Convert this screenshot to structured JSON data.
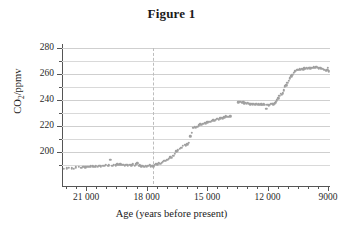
{
  "figure": {
    "title": "Figure 1"
  },
  "chart_data": {
    "type": "scatter",
    "title": "Figure 1",
    "xlabel": "Age (years before present)",
    "ylabel": "CO2/ppmv",
    "ylabel_html": "CO<sub>2</sub>/ppmv",
    "xlim": [
      22200,
      8900
    ],
    "ylim": [
      185,
      285
    ],
    "x_inverted": true,
    "grid": "horizontal",
    "legend": "none",
    "marker": {
      "shape": "circle",
      "color": "#a0a0a0",
      "size_px": 2.4
    },
    "xticks_major": [
      21000,
      18000,
      15000,
      12000,
      9000
    ],
    "xticks_major_labels": [
      "21 000",
      "18 000",
      "15 000",
      "12 000",
      "9000"
    ],
    "xticks_minor_step": 500,
    "yticks_major": [
      200,
      220,
      240,
      260,
      280
    ],
    "yticks_major_labels": [
      "200",
      "220",
      "240",
      "260",
      "280"
    ],
    "yticks_minor_step": 10,
    "annotations": [
      {
        "type": "vline",
        "x": 17700,
        "style": "dashed",
        "color": "#bdbdbd"
      }
    ],
    "series": [
      {
        "name": "CO2 concentration",
        "points": [
          [
            22100,
            187.0
          ],
          [
            21950,
            187.5
          ],
          [
            21850,
            188.0
          ],
          [
            21700,
            187.6
          ],
          [
            21600,
            187.3
          ],
          [
            21500,
            188.2
          ],
          [
            21380,
            188.4
          ],
          [
            21250,
            188.0
          ],
          [
            21150,
            188.6
          ],
          [
            21050,
            188.3
          ],
          [
            20950,
            188.8
          ],
          [
            20850,
            188.5
          ],
          [
            20760,
            188.9
          ],
          [
            20680,
            189.1
          ],
          [
            20600,
            188.7
          ],
          [
            20520,
            189.0
          ],
          [
            20430,
            188.6
          ],
          [
            20350,
            189.3
          ],
          [
            20260,
            189.0
          ],
          [
            20180,
            189.6
          ],
          [
            20100,
            189.2
          ],
          [
            20020,
            190.0
          ],
          [
            19940,
            189.4
          ],
          [
            19870,
            189.8
          ],
          [
            19800,
            193.9
          ],
          [
            19700,
            189.5
          ],
          [
            19620,
            190.2
          ],
          [
            19540,
            189.8
          ],
          [
            19460,
            190.4
          ],
          [
            19380,
            190.0
          ],
          [
            19300,
            190.6
          ],
          [
            19230,
            190.2
          ],
          [
            19150,
            190.0
          ],
          [
            19070,
            189.6
          ],
          [
            19000,
            190.3
          ],
          [
            18920,
            189.9
          ],
          [
            18840,
            190.1
          ],
          [
            18760,
            189.7
          ],
          [
            18680,
            190.4
          ],
          [
            18600,
            189.4
          ],
          [
            18530,
            190.6
          ],
          [
            18460,
            191.4
          ],
          [
            18400,
            189.2
          ],
          [
            18330,
            189.8
          ],
          [
            18260,
            189.0
          ],
          [
            18190,
            189.4
          ],
          [
            18120,
            188.8
          ],
          [
            18050,
            189.2
          ],
          [
            17980,
            188.6
          ],
          [
            17910,
            189.6
          ],
          [
            17840,
            190.2
          ],
          [
            17780,
            189.0
          ],
          [
            17720,
            189.6
          ],
          [
            17660,
            188.9
          ],
          [
            17600,
            190.3
          ],
          [
            17540,
            190.8
          ],
          [
            17470,
            190.4
          ],
          [
            17400,
            191.6
          ],
          [
            17330,
            190.9
          ],
          [
            17260,
            191.8
          ],
          [
            17190,
            192.6
          ],
          [
            17120,
            193.4
          ],
          [
            17050,
            193.0
          ],
          [
            16980,
            193.9
          ],
          [
            16900,
            194.8
          ],
          [
            16830,
            196.0
          ],
          [
            16760,
            195.4
          ],
          [
            16680,
            197.2
          ],
          [
            16600,
            198.4
          ],
          [
            16520,
            200.6
          ],
          [
            16440,
            201.3
          ],
          [
            16360,
            202.4
          ],
          [
            16280,
            203.1
          ],
          [
            16200,
            204.8
          ],
          [
            16120,
            205.6
          ],
          [
            16050,
            205.3
          ],
          [
            15980,
            206.0
          ],
          [
            15900,
            207.0
          ],
          [
            15830,
            212.2
          ],
          [
            15760,
            214.6
          ],
          [
            15690,
            218.5
          ],
          [
            15620,
            219.2
          ],
          [
            15550,
            218.8
          ],
          [
            15480,
            219.6
          ],
          [
            15400,
            220.4
          ],
          [
            15330,
            221.3
          ],
          [
            15260,
            220.8
          ],
          [
            15190,
            221.9
          ],
          [
            15120,
            222.4
          ],
          [
            15050,
            222.0
          ],
          [
            14980,
            222.9
          ],
          [
            14910,
            223.4
          ],
          [
            14840,
            223.0
          ],
          [
            14770,
            223.8
          ],
          [
            14700,
            224.4
          ],
          [
            14630,
            224.0
          ],
          [
            14560,
            224.9
          ],
          [
            14490,
            225.4
          ],
          [
            14420,
            225.0
          ],
          [
            14350,
            225.8
          ],
          [
            14280,
            226.3
          ],
          [
            14210,
            226.0
          ],
          [
            14140,
            226.8
          ],
          [
            14070,
            227.4
          ],
          [
            14000,
            227.0
          ],
          [
            13930,
            227.2
          ],
          [
            13840,
            227.6
          ],
          [
            13450,
            238.3
          ],
          [
            13390,
            238.8
          ],
          [
            13330,
            238.4
          ],
          [
            13270,
            237.9
          ],
          [
            13210,
            238.2
          ],
          [
            13150,
            237.6
          ],
          [
            13090,
            237.9
          ],
          [
            13030,
            237.3
          ],
          [
            12970,
            237.7
          ],
          [
            12910,
            237.2
          ],
          [
            12850,
            236.8
          ],
          [
            12790,
            237.1
          ],
          [
            12730,
            236.6
          ],
          [
            12670,
            237.0
          ],
          [
            12610,
            236.5
          ],
          [
            12550,
            236.9
          ],
          [
            12490,
            236.4
          ],
          [
            12430,
            236.8
          ],
          [
            12370,
            236.3
          ],
          [
            12310,
            236.7
          ],
          [
            12250,
            236.2
          ],
          [
            12190,
            236.6
          ],
          [
            12130,
            236.1
          ],
          [
            12070,
            233.4
          ],
          [
            12010,
            236.4
          ],
          [
            11950,
            236.0
          ],
          [
            11890,
            236.5
          ],
          [
            11830,
            236.9
          ],
          [
            11770,
            237.3
          ],
          [
            11710,
            236.8
          ],
          [
            11650,
            237.6
          ],
          [
            11590,
            238.2
          ],
          [
            11530,
            239.8
          ],
          [
            11470,
            241.4
          ],
          [
            11410,
            243.2
          ],
          [
            11350,
            244.6
          ],
          [
            11300,
            244.0
          ],
          [
            11250,
            245.2
          ],
          [
            11190,
            247.4
          ],
          [
            11130,
            250.6
          ],
          [
            11070,
            251.4
          ],
          [
            11010,
            253.2
          ],
          [
            10950,
            255.0
          ],
          [
            10890,
            256.6
          ],
          [
            10830,
            258.2
          ],
          [
            10770,
            259.6
          ],
          [
            10710,
            260.8
          ],
          [
            10650,
            262.0
          ],
          [
            10590,
            262.6
          ],
          [
            10530,
            263.2
          ],
          [
            10470,
            263.0
          ],
          [
            10410,
            263.6
          ],
          [
            10350,
            263.2
          ],
          [
            10290,
            264.0
          ],
          [
            10230,
            263.6
          ],
          [
            10170,
            264.3
          ],
          [
            10110,
            263.9
          ],
          [
            10050,
            264.6
          ],
          [
            9990,
            264.2
          ],
          [
            9930,
            264.8
          ],
          [
            9870,
            264.4
          ],
          [
            9810,
            265.0
          ],
          [
            9750,
            264.6
          ],
          [
            9690,
            265.2
          ],
          [
            9630,
            264.8
          ],
          [
            9570,
            265.4
          ],
          [
            9510,
            264.9
          ],
          [
            9450,
            264.4
          ],
          [
            9390,
            264.9
          ],
          [
            9330,
            264.2
          ],
          [
            9270,
            263.8
          ],
          [
            9210,
            263.4
          ],
          [
            9150,
            263.0
          ],
          [
            9090,
            262.6
          ],
          [
            9040,
            263.4
          ],
          [
            9000,
            264.6
          ],
          [
            8960,
            262.0
          ]
        ]
      }
    ]
  }
}
